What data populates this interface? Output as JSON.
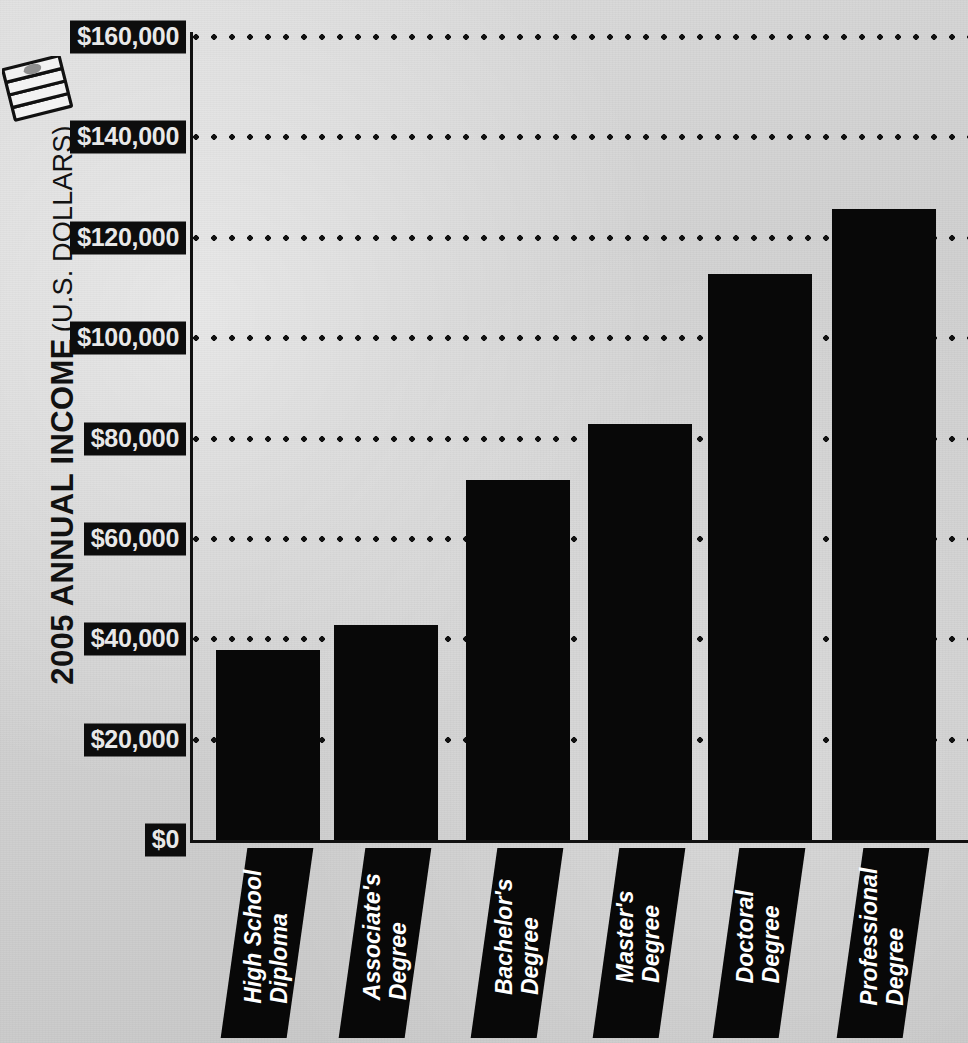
{
  "background_color": "#d2d2d2",
  "ink_color": "#080808",
  "label_text_color": "#e8e8e8",
  "icon": {
    "name": "stack-of-bills-icon",
    "label": "money-stack"
  },
  "axis": {
    "y_title_main": "2005 ANNUAL INCOME",
    "y_title_sub": "(U.S. DOLLARS)"
  },
  "chart_data": {
    "type": "bar",
    "title": "2005 ANNUAL INCOME (U.S. DOLLARS)",
    "xlabel": "",
    "ylabel": "2005 ANNUAL INCOME (U.S. DOLLARS)",
    "ylim": [
      0,
      160000
    ],
    "ytick_step": 20000,
    "grid": true,
    "legend": false,
    "categories": [
      "High School Diploma",
      "Associate's Degree",
      "Bachelor's Degree",
      "Master's Degree",
      "Doctoral Degree",
      "Professional Degree"
    ],
    "category_lines": [
      [
        "High School",
        "Diploma"
      ],
      [
        "Associate's",
        "Degree"
      ],
      [
        "Bachelor's",
        "Degree"
      ],
      [
        "Master's",
        "Degree"
      ],
      [
        "Doctoral",
        "Degree"
      ],
      [
        "Professional",
        "Degree"
      ]
    ],
    "values": [
      38000,
      43000,
      72000,
      83000,
      113000,
      126000
    ],
    "ytick_labels": [
      "$0",
      "$20,000",
      "$40,000",
      "$60,000",
      "$80,000",
      "$100,000",
      "$120,000",
      "$140,000",
      "$160,000"
    ],
    "ytick_values": [
      0,
      20000,
      40000,
      60000,
      80000,
      100000,
      120000,
      140000,
      160000
    ]
  }
}
